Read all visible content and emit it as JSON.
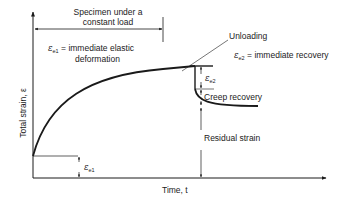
{
  "diagram": {
    "type": "creep-strain-time",
    "loading_span_label_line1": "Specimen under a",
    "loading_span_label_line2": "constant load",
    "elastic_deformation": {
      "symbol": "ε",
      "subscript": "e1",
      "text": "= immediate elastic",
      "text_line2": "deformation"
    },
    "unloading_label": "Unloading",
    "immediate_recovery": {
      "symbol": "ε",
      "subscript": "e2",
      "text": "= immediate recovery"
    },
    "creep_recovery_label": "Creep recovery",
    "residual_strain_label": "Residual strain",
    "y_axis_label": "Total strain, ε",
    "x_axis_label": "Time, t",
    "e1_marker": {
      "symbol": "ε",
      "subscript": "e1"
    },
    "e2_marker": {
      "symbol": "ε",
      "subscript": "e2"
    },
    "colors": {
      "ink": "#1a1a1a",
      "background": "#ffffff"
    }
  }
}
